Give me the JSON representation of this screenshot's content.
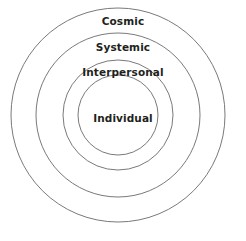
{
  "diagram": {
    "type": "concentric-circles",
    "title": "",
    "background_color": "#ffffff",
    "stroke_color": "#6a6a6a",
    "text_color": "#231f20",
    "center": {
      "x": 118,
      "y": 115
    },
    "rings": [
      {
        "id": "cosmic",
        "label": "Cosmic",
        "level": 4,
        "radius": 107,
        "label_y": 21,
        "fill": "none",
        "stroke": "#6a6a6a"
      },
      {
        "id": "systemic",
        "label": "Systemic",
        "level": 3,
        "radius": 82,
        "label_y": 47,
        "fill": "none",
        "stroke": "#6a6a6a"
      },
      {
        "id": "interpersonal",
        "label": "Interpersonal",
        "level": 2,
        "radius": 55,
        "label_y": 72,
        "fill": "none",
        "stroke": "#6a6a6a"
      },
      {
        "id": "individual",
        "label": "Individual",
        "level": 1,
        "radius": 40,
        "label_y": 118,
        "fill": "none",
        "stroke": "#6a6a6a"
      }
    ]
  }
}
